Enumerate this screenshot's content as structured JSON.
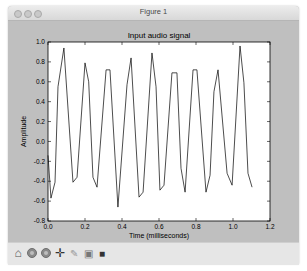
{
  "window": {
    "title": "Figure 1",
    "traffic_lights": [
      "close-button",
      "minimize-button",
      "zoom-button"
    ]
  },
  "toolbar": {
    "buttons": [
      {
        "name": "home",
        "icon": "home-icon",
        "glyph": "⌂"
      },
      {
        "name": "back",
        "icon": "back-arrow-icon",
        "glyph": "◀"
      },
      {
        "name": "forward",
        "icon": "forward-arrow-icon",
        "glyph": "▶"
      },
      {
        "name": "pan",
        "icon": "pan-move-icon",
        "glyph": "✛"
      },
      {
        "name": "zoom",
        "icon": "zoom-rect-icon",
        "glyph": "✎"
      },
      {
        "name": "configure",
        "icon": "configure-subplots-icon",
        "glyph": "▣"
      },
      {
        "name": "save",
        "icon": "save-icon",
        "glyph": "■"
      }
    ]
  },
  "chart_data": {
    "type": "line",
    "title": "Input audio signal",
    "xlabel": "Time (milliseconds)",
    "ylabel": "Amplitude",
    "xlim": [
      0.0,
      1.2
    ],
    "ylim": [
      -0.8,
      1.0
    ],
    "xticks": [
      "0.0",
      "0.2",
      "0.4",
      "0.6",
      "0.8",
      "1.0",
      "1.2"
    ],
    "yticks": [
      "1.0",
      "0.8",
      "0.6",
      "0.4",
      "0.2",
      "0.0",
      "-0.2",
      "-0.4",
      "-0.6",
      "-0.8"
    ],
    "grid": false,
    "legend": null,
    "line_color": "#000000",
    "series": [
      {
        "name": "signal",
        "x": [
          0.0,
          0.016,
          0.038,
          0.054,
          0.086,
          0.135,
          0.157,
          0.2,
          0.22,
          0.243,
          0.265,
          0.314,
          0.335,
          0.378,
          0.427,
          0.449,
          0.492,
          0.514,
          0.562,
          0.584,
          0.605,
          0.627,
          0.67,
          0.697,
          0.719,
          0.741,
          0.784,
          0.805,
          0.854,
          0.876,
          0.897,
          0.919,
          0.968,
          0.995,
          1.038,
          1.059,
          1.081,
          1.103
        ],
        "y": [
          -0.14,
          -0.57,
          -0.41,
          0.55,
          0.94,
          -0.41,
          -0.36,
          0.79,
          0.6,
          -0.36,
          -0.46,
          0.72,
          0.72,
          -0.66,
          0.57,
          0.84,
          -0.56,
          -0.51,
          0.89,
          0.55,
          -0.49,
          -0.44,
          0.69,
          0.69,
          -0.27,
          -0.51,
          0.72,
          0.72,
          -0.51,
          -0.34,
          0.5,
          0.72,
          -0.32,
          -0.44,
          0.96,
          0.59,
          -0.32,
          -0.46
        ]
      }
    ]
  }
}
